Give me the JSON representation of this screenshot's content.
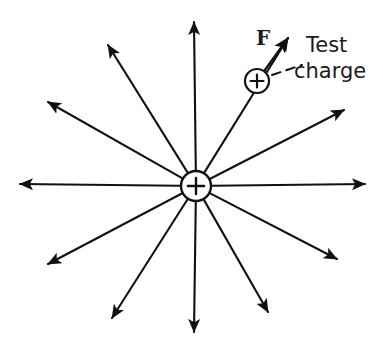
{
  "figure": {
    "background_color": "#ffffff",
    "stroke_color": "#111111",
    "width": 383,
    "height": 353
  },
  "source_charge": {
    "name": "source-point-charge",
    "sign": "+",
    "cx": 196,
    "cy": 186,
    "r": 15,
    "stroke_width": 2.4
  },
  "test_charge": {
    "name": "test-charge",
    "sign": "+",
    "cx": 257,
    "cy": 81,
    "r": 12,
    "stroke_width": 2.2,
    "label_line_1": "Test",
    "label_line_2": "charge"
  },
  "force_vector": {
    "label": "F",
    "tail_x": 257,
    "tail_y": 81,
    "tip_x": 288,
    "tip_y": 38
  },
  "leader_line": {
    "name": "callout-leader",
    "x1": 272,
    "y1": 75,
    "x2": 302,
    "y2": 65,
    "dash": "9 6"
  },
  "field_lines": {
    "count": 12,
    "note": "Radial electric field lines pointing outward from the positive source charge",
    "rays": [
      {
        "id": "ray-up",
        "angle_deg": 90,
        "tip_x": 194,
        "tip_y": 22
      },
      {
        "id": "ray-up-left-steep",
        "angle_deg": 118,
        "tip_x": 108,
        "tip_y": 45
      },
      {
        "id": "ray-up-left",
        "angle_deg": 148,
        "tip_x": 48,
        "tip_y": 102
      },
      {
        "id": "ray-left",
        "angle_deg": 180,
        "tip_x": 20,
        "tip_y": 184
      },
      {
        "id": "ray-down-left",
        "angle_deg": 212,
        "tip_x": 48,
        "tip_y": 264
      },
      {
        "id": "ray-down-left-steep",
        "angle_deg": 243,
        "tip_x": 112,
        "tip_y": 318
      },
      {
        "id": "ray-down",
        "angle_deg": 270,
        "tip_x": 194,
        "tip_y": 332
      },
      {
        "id": "ray-down-right-steep",
        "angle_deg": 297,
        "tip_x": 268,
        "tip_y": 312
      },
      {
        "id": "ray-down-right",
        "angle_deg": 328,
        "tip_x": 337,
        "tip_y": 259
      },
      {
        "id": "ray-right",
        "angle_deg": 0,
        "tip_x": 365,
        "tip_y": 184
      },
      {
        "id": "ray-up-right",
        "angle_deg": 32,
        "tip_x": 344,
        "tip_y": 110
      },
      {
        "id": "ray-up-right-steep",
        "angle_deg": 60,
        "tip_x": 288,
        "tip_y": 38
      }
    ]
  }
}
